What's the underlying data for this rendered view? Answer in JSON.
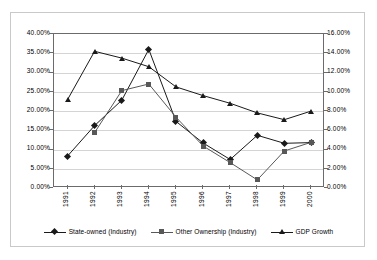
{
  "chart_data": {
    "type": "line",
    "title": "",
    "xlabel": "",
    "ylabel": "",
    "grid": true,
    "legend_position": "bottom",
    "categories": [
      "1991",
      "1992",
      "1993",
      "1994",
      "1995",
      "1996",
      "1997",
      "1998",
      "1999",
      "2000"
    ],
    "axes": {
      "left": {
        "label": "",
        "ylim": [
          0,
          40
        ],
        "tick_step": 5,
        "ticks": [
          "0.00%",
          "5.00%",
          "10.00%",
          "15.00%",
          "20.00%",
          "25.00%",
          "30.00%",
          "35.00%",
          "40.00%"
        ],
        "tick_values": [
          0,
          5,
          10,
          15,
          20,
          25,
          30,
          35,
          40
        ]
      },
      "right": {
        "label": "",
        "ylim": [
          0,
          16
        ],
        "tick_step": 2,
        "ticks": [
          "0.00%",
          "2.00%",
          "4.00%",
          "6.00%",
          "8.00%",
          "10.00%",
          "12.00%",
          "14.00%",
          "16.00%"
        ],
        "tick_values": [
          0,
          2,
          4,
          6,
          8,
          10,
          12,
          14,
          16
        ]
      }
    },
    "series": [
      {
        "name": "State-owned (Industry)",
        "axis": "left",
        "marker": "diamond",
        "color": "#1a1a1a",
        "values": [
          8.3,
          16.2,
          22.8,
          36.0,
          17.3,
          11.7,
          7.4,
          13.7,
          11.6,
          11.8
        ]
      },
      {
        "name": "Other Ownership (Industry)",
        "axis": "left",
        "marker": "square",
        "color": "#585858",
        "values": [
          null,
          14.4,
          25.3,
          27.0,
          18.4,
          10.9,
          6.6,
          2.1,
          9.6,
          11.9
        ]
      },
      {
        "name": "GDP Growth",
        "axis": "right",
        "marker": "triangle",
        "color": "#1a1a1a",
        "values": [
          9.2,
          14.2,
          13.5,
          12.6,
          10.5,
          9.6,
          8.8,
          7.8,
          7.1,
          8.0
        ]
      }
    ]
  },
  "legend": {
    "items": [
      {
        "label": "State-owned (Industry)"
      },
      {
        "label": "Other Ownership (Industry)"
      },
      {
        "label": "GDP Growth"
      }
    ]
  }
}
